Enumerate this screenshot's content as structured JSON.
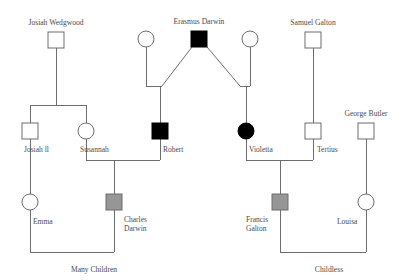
{
  "chart_title": "",
  "canvas": {
    "width": 406,
    "height": 280,
    "background": "#ffffff"
  },
  "colors": {
    "line": "#6d6d6d",
    "text": "#4a4a4a",
    "unaffected_fill": "#ffffff",
    "affected_fill": "#000000",
    "partial_fill": "#969696"
  },
  "legend_semantics": {
    "square": "male",
    "circle": "female",
    "white": "unfilled",
    "black": "filled",
    "gray": "half-filled"
  },
  "people": [
    {
      "id": "josiah_wedgwood",
      "label": "Josiah Wedgwood",
      "label_position": "above",
      "shape": "square",
      "fill": "white",
      "x": 56,
      "y": 40
    },
    {
      "id": "erasmus_darwin",
      "label": "Erasmus Darwin",
      "label_position": "above",
      "shape": "square",
      "fill": "black",
      "x": 199,
      "y": 39
    },
    {
      "id": "erasmus_wife_left",
      "label": "",
      "label_position": "none",
      "shape": "circle",
      "fill": "white",
      "x": 146,
      "y": 39
    },
    {
      "id": "erasmus_wife_right",
      "label": "",
      "label_position": "none",
      "shape": "circle",
      "fill": "white",
      "x": 250,
      "y": 39
    },
    {
      "id": "samuel_galton",
      "label": "Samuel Galton",
      "label_position": "above",
      "shape": "square",
      "fill": "white",
      "x": 313,
      "y": 40
    },
    {
      "id": "george_butler",
      "label": "George Butler",
      "label_position": "above",
      "shape": "square",
      "fill": "white",
      "x": 366,
      "y": 131
    },
    {
      "id": "josiah_ii",
      "label": "Josiah II",
      "label_position": "below-right",
      "shape": "square",
      "fill": "white",
      "x": 30,
      "y": 131
    },
    {
      "id": "susannah",
      "label": "Susannah",
      "label_position": "below-right",
      "shape": "circle",
      "fill": "white",
      "x": 86,
      "y": 131
    },
    {
      "id": "robert",
      "label": "Robert",
      "label_position": "below-right",
      "shape": "square",
      "fill": "black",
      "x": 160,
      "y": 131
    },
    {
      "id": "violetta",
      "label": "Violetta",
      "label_position": "below-right",
      "shape": "circle",
      "fill": "black",
      "x": 246,
      "y": 131
    },
    {
      "id": "tertius",
      "label": "Tertius",
      "label_position": "below-right",
      "shape": "square",
      "fill": "white",
      "x": 313,
      "y": 131
    },
    {
      "id": "emma",
      "label": "Emma",
      "label_position": "below-right",
      "shape": "circle",
      "fill": "white",
      "x": 30,
      "y": 202
    },
    {
      "id": "charles_darwin",
      "label": "Charles\nDarwin",
      "label_position": "below-right",
      "shape": "square",
      "fill": "gray",
      "x": 114,
      "y": 202
    },
    {
      "id": "francis_galton",
      "label": "Francis\nGalton",
      "label_position": "below-left",
      "shape": "square",
      "fill": "gray",
      "x": 280,
      "y": 202
    },
    {
      "id": "louisa",
      "label": "Louisa",
      "label_position": "below-left",
      "shape": "circle",
      "fill": "white",
      "x": 366,
      "y": 202
    }
  ],
  "labels": {
    "josiah_wedgwood": "Josiah Wedgwood",
    "erasmus_darwin": "Erasmus Darwin",
    "samuel_galton": "Samuel Galton",
    "george_butler": "George Butler",
    "josiah_ii": "Josiah ll",
    "susannah": "Susannah",
    "robert": "Robert",
    "violetta": "Violetta",
    "tertius": "Tertius",
    "emma": "Emma",
    "charles_darwin_line1": "Charles",
    "charles_darwin_line2": "Darwin",
    "francis_galton_line1": "Francis",
    "francis_galton_line2": "Galton",
    "louisa": "Louisa",
    "many_children": "Many Children",
    "childless": "Childless"
  },
  "connections": [
    {
      "id": "josiah-descent",
      "type": "vertical",
      "from": "josiah_wedgwood",
      "to": "sibship-bar-wedgwood"
    },
    {
      "id": "wedgwood-sibship-bar",
      "type": "horizontal",
      "children": [
        "josiah_ii",
        "susannah"
      ]
    },
    {
      "id": "erasmus-left-diagonal",
      "type": "diagonal",
      "from": "erasmus_darwin",
      "to": "robert-union"
    },
    {
      "id": "erasmus-right-diagonal",
      "type": "diagonal",
      "from": "erasmus_darwin",
      "to": "violetta-union"
    },
    {
      "id": "wife-left-descent",
      "type": "vertical",
      "from": "erasmus_wife_left",
      "to": "robert-union"
    },
    {
      "id": "wife-right-descent",
      "type": "vertical",
      "from": "erasmus_wife_right",
      "to": "violetta-union"
    },
    {
      "id": "robert-descent",
      "type": "vertical",
      "from": "robert-union",
      "to": "robert"
    },
    {
      "id": "violetta-descent",
      "type": "vertical",
      "from": "violetta-union",
      "to": "violetta"
    },
    {
      "id": "samuel-descent",
      "type": "vertical",
      "from": "samuel_galton",
      "to": "tertius"
    },
    {
      "id": "george-descent",
      "type": "vertical",
      "from": "george_butler",
      "to": "louisa"
    },
    {
      "id": "susannah-robert-union",
      "type": "mating",
      "partners": [
        "susannah",
        "robert"
      ],
      "child": "charles_darwin"
    },
    {
      "id": "violetta-tertius-union",
      "type": "mating",
      "partners": [
        "violetta",
        "tertius"
      ],
      "child": "francis_galton"
    },
    {
      "id": "emma-charles-union",
      "type": "mating",
      "partners": [
        "emma",
        "charles_darwin"
      ],
      "outcome": "many_children"
    },
    {
      "id": "francis-louisa-union",
      "type": "mating",
      "partners": [
        "francis_galton",
        "louisa"
      ],
      "outcome": "childless"
    },
    {
      "id": "josiah-ii-to-emma",
      "type": "vertical",
      "from": "josiah_ii",
      "to": "emma"
    }
  ],
  "outcomes": [
    {
      "id": "many-children",
      "text": "Many Children",
      "x": 94,
      "y": 270
    },
    {
      "id": "childless",
      "text": "Childless",
      "x": 329,
      "y": 270
    }
  ],
  "geometry": {
    "node_size": 16,
    "circle_radius": 8,
    "row_y_generation1": 39,
    "row_y_generation2": 131,
    "row_y_generation3": 202,
    "many_children_bar_y": 252,
    "childless_bar_y": 252
  }
}
